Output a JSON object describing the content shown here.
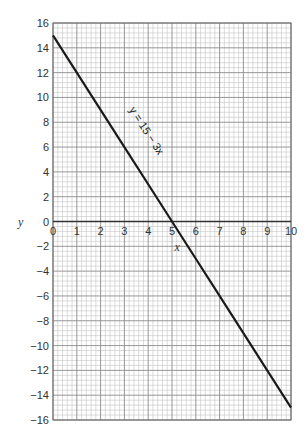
{
  "chart_data": {
    "type": "line",
    "title": "",
    "xlabel": "x",
    "ylabel": "y",
    "xlim": [
      0,
      10
    ],
    "ylim": [
      -16,
      16
    ],
    "x_ticks": [
      0,
      1,
      2,
      3,
      4,
      5,
      6,
      7,
      8,
      9,
      10
    ],
    "y_ticks": [
      16,
      14,
      12,
      10,
      8,
      6,
      4,
      2,
      0,
      -2,
      -4,
      -6,
      -8,
      -10,
      -12,
      -14,
      -16
    ],
    "y_tick_labels": [
      "16",
      "14",
      "12",
      "10",
      "8",
      "6",
      "4",
      "2",
      "0",
      "−2",
      "−4",
      "−6",
      "−8",
      "−10",
      "−12",
      "−14",
      "−16"
    ],
    "grid": true,
    "grid_style": "graph paper: minor every 0.2 in x and 0.4 in y, major every 1 in x and 2 in y",
    "legend": null,
    "series": [
      {
        "name": "y = 15 − 3x",
        "x": [
          0,
          1,
          2,
          3,
          4,
          5,
          6,
          7,
          8,
          9,
          10
        ],
        "values": [
          15,
          12,
          9,
          6,
          3,
          0,
          -3,
          -6,
          -9,
          -12,
          -15
        ]
      }
    ],
    "annotations": [
      {
        "text": "y = 15 − 3x",
        "position": "along line near x=3, y=8",
        "rotation": "parallel to line"
      }
    ],
    "colors": {
      "line": "#1a1a1a",
      "axis": "#333333",
      "grid_major": "#8c8c8c",
      "grid_minor": "#c4c4c4"
    }
  }
}
